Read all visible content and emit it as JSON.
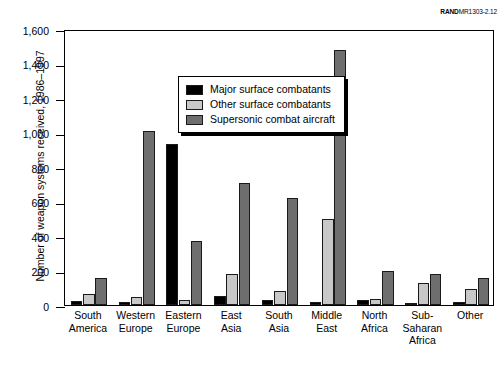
{
  "figure_id": {
    "brand": "RAND",
    "code": "MR1303-2.12"
  },
  "chart_data": {
    "type": "bar",
    "title": "",
    "xlabel": "",
    "ylabel": "Number of weapon systems received, 1986–1997",
    "ylim": [
      0,
      1600
    ],
    "ytick_values": [
      0,
      200,
      400,
      600,
      800,
      1000,
      1200,
      1400,
      1600
    ],
    "ytick_labels": [
      "0",
      "200",
      "400",
      "600",
      "800",
      "1,000",
      "1,200",
      "1,400",
      "1,600"
    ],
    "grid": false,
    "legend_position": "upper-left-inside",
    "categories": [
      "South America",
      "Western Europe",
      "Eastern Europe",
      "East Asia",
      "South Asia",
      "Middle East",
      "North Africa",
      "Sub-Saharan Africa",
      "Other"
    ],
    "category_lines": [
      [
        "South",
        "America"
      ],
      [
        "Western",
        "Europe"
      ],
      [
        "Eastern",
        "Europe"
      ],
      [
        "East",
        "Asia"
      ],
      [
        "South",
        "Asia"
      ],
      [
        "Middle",
        "East"
      ],
      [
        "North",
        "Africa"
      ],
      [
        "Sub-",
        "Saharan",
        "Africa"
      ],
      [
        "Other"
      ]
    ],
    "series": [
      {
        "name": "Major surface combatants",
        "color": "#000000",
        "values": [
          25,
          20,
          935,
          55,
          28,
          15,
          28,
          12,
          18
        ]
      },
      {
        "name": "Other surface combatants",
        "color": "#c8c8c8",
        "values": [
          65,
          48,
          30,
          180,
          80,
          500,
          35,
          130,
          90
        ]
      },
      {
        "name": "Supersonic combat aircraft",
        "color": "#6e6e6e",
        "values": [
          155,
          1010,
          370,
          710,
          620,
          1480,
          195,
          180,
          155
        ]
      }
    ]
  }
}
